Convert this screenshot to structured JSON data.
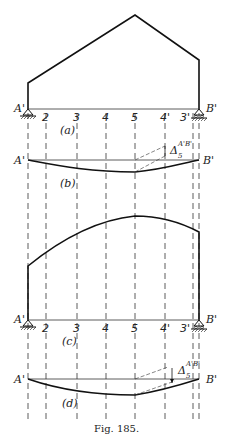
{
  "figure": {
    "caption": "Fig. 185.",
    "support_left": "A'",
    "support_right": "B'",
    "stations": [
      "2",
      "3",
      "4",
      "5",
      "4'",
      "3'"
    ],
    "panels": [
      {
        "id": "a",
        "label": "(a)",
        "description": "Gable frame with fixed/pinned supports"
      },
      {
        "id": "b",
        "label": "(b)",
        "description": "Deflection curve of frame (a)"
      },
      {
        "id": "c",
        "label": "(c)",
        "description": "Frame with curved (arched) roof"
      },
      {
        "id": "d",
        "label": "(d)",
        "description": "Deflection curve of frame (c)"
      }
    ],
    "delta_label": "Δ",
    "delta_subscript": "5",
    "delta_superscript": "A'B'"
  }
}
